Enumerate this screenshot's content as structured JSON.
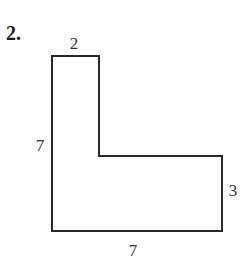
{
  "problem": {
    "number": "2.",
    "shape": "L-shape",
    "labels": {
      "top": "2",
      "left": "7",
      "right": "3",
      "bottom": "7"
    },
    "colors": {
      "stroke": "#2a2a2a",
      "text": "#333333"
    }
  }
}
